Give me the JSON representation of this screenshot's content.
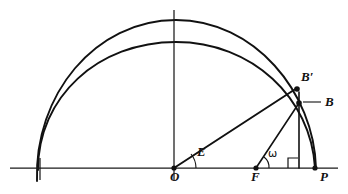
{
  "figure": {
    "name": "ellipse-and-circle-construction",
    "background_color": "#ffffff",
    "stroke_color": "#111111",
    "width": 348,
    "height": 194
  },
  "labels": {
    "origin": "O",
    "focus": "F",
    "vertex": "P",
    "eccentric_anomaly": "E",
    "true_anomaly": "ω",
    "point_on_ellipse": "B",
    "point_on_circle": "B′"
  },
  "points": {
    "O": {
      "label": "O",
      "x": 174,
      "y": 168
    },
    "F": {
      "label": "F",
      "x": 256,
      "y": 168
    },
    "P": {
      "label": "P",
      "x": 315,
      "y": 168
    },
    "B": {
      "label": "B",
      "x": 299,
      "y": 103
    },
    "Bprime": {
      "label": "B′",
      "x": 296,
      "y": 88
    },
    "foot": {
      "label": "",
      "x": 299,
      "y": 168
    }
  },
  "curves": {
    "outer": {
      "name": "auxiliary-circle",
      "center_x": 174,
      "baseline_y": 168,
      "radius_x": 140,
      "radius_y": 148,
      "apex_y": 20
    },
    "inner": {
      "name": "ellipse",
      "center_x": 174,
      "baseline_y": 168,
      "radius_x": 138,
      "radius_y": 126,
      "apex_y": 42
    }
  },
  "axes": {
    "horizontal": {
      "name": "major-axis",
      "x1": 10,
      "y1": 168,
      "x2": 338,
      "y2": 168
    },
    "vertical": {
      "name": "minor-axis",
      "x1": 174,
      "y1": 10,
      "x2": 174,
      "y2": 180
    }
  },
  "angles": {
    "E": {
      "vertex": "O",
      "label": "E",
      "label_x": 199,
      "label_y": 150
    },
    "omega": {
      "vertex": "F",
      "label": "ω",
      "label_x": 270,
      "label_y": 150
    }
  },
  "label_positions": {
    "O": {
      "x": 170,
      "y": 172
    },
    "F": {
      "x": 252,
      "y": 172
    },
    "P": {
      "x": 320,
      "y": 172
    },
    "B": {
      "x": 326,
      "y": 96
    },
    "Bprime": {
      "x": 302,
      "y": 74
    },
    "E": {
      "x": 196,
      "y": 146
    },
    "omega": {
      "x": 267,
      "y": 148
    }
  }
}
